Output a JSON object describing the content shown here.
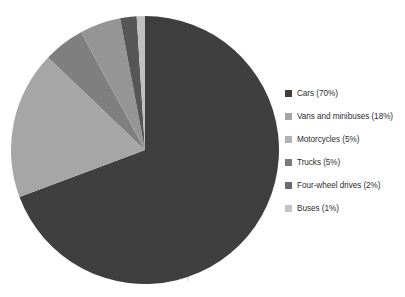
{
  "chart_data": {
    "type": "pie",
    "title": "",
    "subtitle": "",
    "xlabel": "",
    "ylabel": "",
    "grid": false,
    "legend_position": "right",
    "categories": [
      "Cars",
      "Vans and minibuses",
      "Motorcycles",
      "Trucks",
      "Four-wheel drives",
      "Buses"
    ],
    "values": [
      70,
      18,
      5,
      5,
      2,
      1
    ],
    "units": "percent",
    "total": 101,
    "start_angle_deg": 0,
    "direction": "clockwise",
    "slices": [
      {
        "label": "Cars",
        "value": 70,
        "display": "70%",
        "color": "#3f3f3f",
        "start_deg": 0,
        "end_deg": 252
      },
      {
        "label": "Vans and minibuses",
        "value": 18,
        "display": "18%",
        "color": "#a6a6a6",
        "start_deg": 252,
        "end_deg": 316.8
      },
      {
        "label": "Motorcycles",
        "value": 5,
        "display": "5%",
        "color": "#7f7f7f",
        "start_deg": 316.8,
        "end_deg": 334.8
      },
      {
        "label": "Trucks",
        "value": 5,
        "display": "5%",
        "color": "#959595",
        "start_deg": 334.8,
        "end_deg": 352.8
      },
      {
        "label": "Four-wheel drives",
        "value": 2,
        "display": "2%",
        "color": "#565656",
        "start_deg": 352.8,
        "end_deg": 360
      },
      {
        "label": "Buses",
        "value": 1,
        "display": "1%",
        "color": "#bfbfbf",
        "start_deg": 360,
        "end_deg": 363.6
      }
    ]
  },
  "legend": {
    "items": [
      {
        "label": "Cars (70%)",
        "color": "#3f3f3f",
        "swatch_name": "legend-swatch-cars"
      },
      {
        "label": "Vans and minibuses (18%)",
        "color": "#a6a6a6",
        "swatch_name": "legend-swatch-vans-and-minibuses"
      },
      {
        "label": "Motorcycles (5%)",
        "color": "#b2b2b2",
        "swatch_name": "legend-swatch-motorcycles"
      },
      {
        "label": "Trucks (5%)",
        "color": "#7a7a7a",
        "swatch_name": "legend-swatch-trucks"
      },
      {
        "label": "Four-wheel drives (2%)",
        "color": "#6b6b6b",
        "swatch_name": "legend-swatch-four-wheel-drives"
      },
      {
        "label": "Buses (1%)",
        "color": "#c4c4c4",
        "swatch_name": "legend-swatch-buses"
      }
    ]
  },
  "style": {
    "background": "#ffffff",
    "text_color": "#2e2e2e",
    "plot_gridline": "#555555"
  }
}
